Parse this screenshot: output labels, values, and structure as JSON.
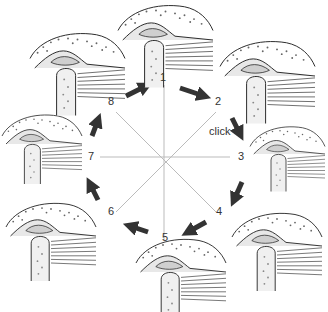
{
  "diagram": {
    "positions": [
      {
        "id": "1",
        "label": "1"
      },
      {
        "id": "2",
        "label": "2"
      },
      {
        "id": "3",
        "label": "3"
      },
      {
        "id": "4",
        "label": "4"
      },
      {
        "id": "5",
        "label": "5"
      },
      {
        "id": "6",
        "label": "6"
      },
      {
        "id": "7",
        "label": "7"
      },
      {
        "id": "8",
        "label": "8"
      }
    ],
    "annotation": "click",
    "colors": {
      "arrow": "#333333",
      "spoke": "#bbbbbb",
      "bone": "#e8e8e8",
      "disc": "#cfcfcf",
      "ink": "#222222"
    }
  }
}
